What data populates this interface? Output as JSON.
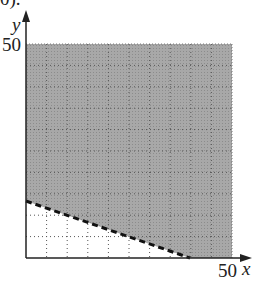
{
  "chart_data": {
    "type": "area",
    "title": "",
    "xlabel": "x",
    "ylabel": "y",
    "xlim": [
      0,
      50
    ],
    "ylim": [
      0,
      50
    ],
    "x_tick_labels": [
      "50"
    ],
    "y_tick_labels": [
      "50"
    ],
    "grid": true,
    "grid_step": 5,
    "boundary_line": {
      "style": "dashed",
      "points": [
        [
          0,
          13.3
        ],
        [
          40,
          0
        ]
      ]
    },
    "shaded_region": "above the dashed line (x + 3y > 40) within the first quadrant up to 50",
    "unshaded_region": "below the dashed line near origin"
  },
  "labels": {
    "y_axis": "y",
    "x_axis": "x",
    "y_max": "50",
    "x_max": "50",
    "top_fragment": "0)."
  }
}
